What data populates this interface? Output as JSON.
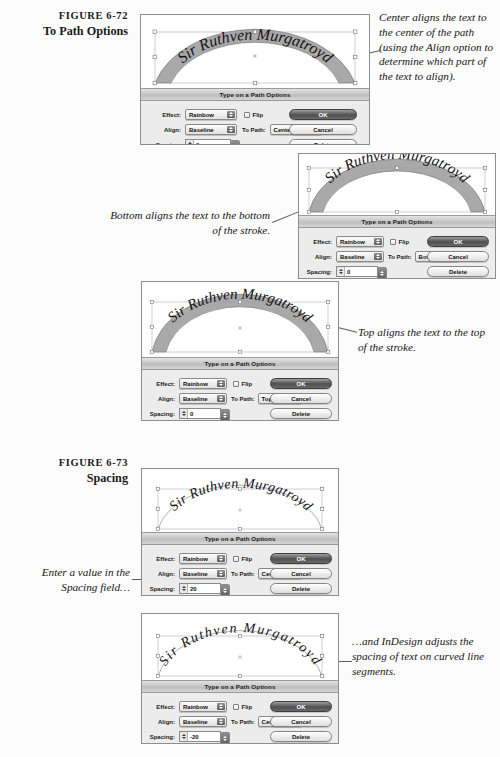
{
  "document": {
    "background_color": "#fcfcfc",
    "artwork_text": "Sir Ruthven Murgatroyd"
  },
  "figures": [
    {
      "number": "FIGURE 6-72",
      "title": "To Path Options"
    },
    {
      "number": "FIGURE 6-73",
      "title": "Spacing"
    }
  ],
  "annotations": [
    {
      "id": "center-note",
      "text": "Center aligns the text to the center of the path (using the Align option to determine which part of the text to align)."
    },
    {
      "id": "bottom-note",
      "text": "Bottom aligns the text to the bottom of the stroke."
    },
    {
      "id": "top-note",
      "text": "Top aligns the text to the top of the stroke."
    },
    {
      "id": "spacing-enter-note",
      "text": "Enter a value in the Spacing field…"
    },
    {
      "id": "spacing-result-note",
      "text": "…and InDesign adjusts the spacing of text on curved line segments."
    }
  ],
  "dialog_labels": {
    "title": "Type on a Path Options",
    "effect": "Effect:",
    "align": "Align:",
    "to_path": "To Path:",
    "spacing": "Spacing:",
    "flip": "Flip",
    "preview": "Preview",
    "ok": "OK",
    "cancel": "Cancel",
    "delete": "Delete"
  },
  "panels": [
    {
      "id": "panel-center",
      "artwork_style": "thick-gray-arc-band",
      "dialog": {
        "title": "Type on a Path Options",
        "effect": "Rainbow",
        "flip_checked": false,
        "align": "Baseline",
        "to_path": "Center",
        "spacing": "0",
        "preview_checked": false,
        "preview_visible": false,
        "buttons": [
          "OK",
          "Cancel",
          "Delete"
        ]
      }
    },
    {
      "id": "panel-bottom",
      "artwork_style": "thick-gray-arc-band",
      "dialog": {
        "title": "Type on a Path Options",
        "effect": "Rainbow",
        "flip_checked": false,
        "align": "Baseline",
        "to_path": "Bottom",
        "spacing": "0",
        "preview_checked": true,
        "preview_visible": true,
        "buttons": [
          "OK",
          "Cancel",
          "Delete"
        ]
      }
    },
    {
      "id": "panel-top",
      "artwork_style": "thick-gray-arc-band",
      "dialog": {
        "title": "Type on a Path Options",
        "effect": "Rainbow",
        "flip_checked": false,
        "align": "Baseline",
        "to_path": "Top",
        "spacing": "0",
        "preview_checked": true,
        "preview_visible": true,
        "buttons": [
          "OK",
          "Cancel",
          "Delete"
        ]
      }
    },
    {
      "id": "panel-spacing-20",
      "artwork_style": "thin-arc-path",
      "dialog": {
        "title": "Type on a Path Options",
        "effect": "Rainbow",
        "flip_checked": false,
        "align": "Baseline",
        "to_path": "Center",
        "spacing": "20",
        "preview_checked": true,
        "preview_visible": true,
        "buttons": [
          "OK",
          "Cancel",
          "Delete"
        ]
      }
    },
    {
      "id": "panel-spacing-minus20",
      "artwork_style": "thin-arc-path",
      "dialog": {
        "title": "Type on a Path Options",
        "effect": "Rainbow",
        "flip_checked": false,
        "align": "Baseline",
        "to_path": "Center",
        "spacing": "-20",
        "preview_checked": true,
        "preview_visible": true,
        "buttons": [
          "OK",
          "Cancel",
          "Delete"
        ]
      }
    }
  ]
}
